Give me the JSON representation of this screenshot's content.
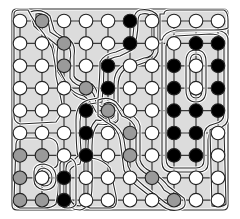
{
  "puzzle": {
    "title": "Grid loop puzzle",
    "cols": 10,
    "rows": 9,
    "origin": {
      "x": 20,
      "y": 21
    },
    "spacing": {
      "x": 22.0,
      "y": 22.4
    },
    "colors": {
      "background": "#ffffff",
      "region_fill": "#dcdcdc",
      "grid_line": "#3a3a3a",
      "outline": "#2a2a2a",
      "white_stone": "#ffffff",
      "gray_stone": "#9a9a9a",
      "black_stone": "#000000"
    },
    "legend": {
      "W": "white",
      "G": "gray",
      "B": "black"
    },
    "cells": [
      [
        "W",
        "G",
        "W",
        "W",
        "W",
        "B",
        "W",
        "W",
        "W",
        "W"
      ],
      [
        "W",
        "W",
        "G",
        "W",
        "W",
        "B",
        "W",
        "W",
        "B",
        "B"
      ],
      [
        "W",
        "W",
        "G",
        "W",
        "B",
        "W",
        "W",
        "B",
        "W",
        "B"
      ],
      [
        "W",
        "W",
        "W",
        "G",
        "B",
        "W",
        "W",
        "B",
        "W",
        "B"
      ],
      [
        "W",
        "W",
        "W",
        "B",
        "G",
        "W",
        "W",
        "B",
        "B",
        "B"
      ],
      [
        "W",
        "W",
        "W",
        "B",
        "W",
        "G",
        "W",
        "B",
        "B",
        "W"
      ],
      [
        "G",
        "G",
        "W",
        "B",
        "W",
        "G",
        "W",
        "B",
        "B",
        "W"
      ],
      [
        "G",
        "W",
        "B",
        "W",
        "W",
        "W",
        "G",
        "W",
        "W",
        "W"
      ],
      [
        "G",
        "G",
        "B",
        "W",
        "W",
        "W",
        "W",
        "G",
        "W",
        "W"
      ]
    ],
    "outlines": [
      {
        "name": "outer-border",
        "d": "M12,14 Q12,9 17,9 L223,9 Q228,9 228,14 L228,205 Q228,210 223,210 L17,210 Q12,210 12,205 Z"
      },
      {
        "name": "gray-snake-top-outer",
        "d": "M30,12 Q42,8 50,16 L54,30 Q58,36 70,40 Q76,46 74,56 L74,76 Q76,82 92,84 Q98,90 98,98 L102,104 Q112,100 118,108 L118,118 Q116,124 108,122 L98,116 Q92,104 86,100 Q76,98 72,92 L58,72 Q54,64 54,50 L52,40 Q40,32 34,26 Z"
      },
      {
        "name": "gray-snake-top-inner",
        "d": "M36,14 Q44,12 48,20 L50,32 Q60,38 68,44 Q72,52 70,60 L70,78 Q74,86 88,88 Q96,94 96,104 L104,108 Q114,106 114,114 Q112,120 104,118 L96,112 Q90,100 84,96 Q74,94 68,86 L58,68 Q56,58 58,46 L48,38 Q38,30 36,22 Z"
      },
      {
        "name": "black-snake-outer",
        "d": "M140,10 Q152,8 158,16 L158,52 Q156,60 146,62 L124,70 Q118,76 118,86 L118,120 Q116,126 98,124 Q92,130 92,146 L92,186 Q92,208 80,210 Q68,210 66,200 L66,168 Q66,162 74,160 L78,156 Q76,150 76,120 Q76,104 88,100 L98,98 Q100,78 100,62 Q104,54 116,52 L130,46 Q134,38 134,20 Q134,12 140,10 Z"
      },
      {
        "name": "black-snake-inner",
        "d": "M142,14 Q150,12 154,20 L154,50 Q152,58 144,58 L122,66 Q114,72 114,84 L114,116 Q110,122 96,120 Q88,128 88,146 L88,190 Q88,204 80,206 Q72,206 70,198 L70,170 Q72,166 80,164 L82,156 Q80,148 80,122 Q80,108 90,104 L102,102 Q104,82 104,64 Q108,58 120,56 L132,50 Q138,40 138,22 Q138,14 142,14 Z"
      },
      {
        "name": "gray-snake-bottom-outer",
        "d": "M98,100 Q108,96 116,102 L124,112 Q138,116 140,126 L140,160 Q142,168 152,172 Q162,178 168,186 L184,198 Q188,208 178,210 Q168,212 160,204 L142,190 Q128,180 124,170 L120,140 Q118,128 106,122 L98,116 Z"
      },
      {
        "name": "gray-snake-bottom-inner",
        "d": "M104,104 Q110,100 116,106 L122,116 Q134,120 136,130 L136,162 Q138,170 150,176 Q160,182 164,190 L180,200 Q182,206 176,206 Q168,206 162,200 L144,186 Q132,176 128,166 L124,140 Q122,128 110,122 Z"
      },
      {
        "name": "black-block-outer",
        "d": "M162,42 Q162,34 170,32 L212,30 Q228,30 228,40 L228,118 Q228,126 218,128 Q208,130 208,140 L208,164 Q208,172 198,172 L172,172 Q162,172 162,162 Z"
      },
      {
        "name": "black-block-inner",
        "d": "M166,46 Q168,38 176,36 L210,34 Q224,34 224,44 L224,114 Q224,122 214,124 Q204,126 204,136 L204,160 Q204,168 196,168 L174,168 Q166,168 166,158 Z"
      },
      {
        "name": "black-block-hole-outer",
        "d": "M186,62 Q186,50 196,50 Q206,50 206,62 L206,90 Q206,102 196,102 Q186,102 186,90 Z"
      },
      {
        "name": "black-block-hole-inner",
        "d": "M190,62 Q190,54 196,54 Q202,54 202,62 L202,90 Q202,98 196,98 Q190,98 190,90 Z"
      },
      {
        "name": "right-top-row-loop",
        "d": "M164,14 Q164,10 170,10 L224,10 Q228,12 228,20 L228,28 Q224,30 214,30 L176,30 Q164,32 162,40 L160,40 L160,14 Z"
      },
      {
        "name": "right-col-lower-loop",
        "d": "M210,130 Q218,124 224,130 L226,204 Q222,208 212,206 Z"
      },
      {
        "name": "left-top-region",
        "d": "M14,14 Q14,10 20,10 L28,10 Q34,22 44,34 L52,48 Q56,66 56,76 L62,104 Q64,112 56,122 L20,124 Q14,122 14,116 Z"
      },
      {
        "name": "bottom-left-outer",
        "d": "M16,144 Q16,138 24,138 L50,138 Q58,140 58,148 L58,162 Q58,168 52,168 Q60,176 58,192 L56,204 Q52,208 44,208 L20,208 Q14,206 14,200 Z"
      },
      {
        "name": "bottom-left-hole-outer",
        "d": "M34,172 Q34,164 44,164 Q56,166 56,178 Q56,190 44,190 Q34,188 34,180 Z"
      },
      {
        "name": "bottom-left-hole-inner",
        "d": "M37,174 Q38,168 44,168 Q52,170 52,178 Q52,186 44,186 Q38,184 37,180 Z"
      },
      {
        "name": "bottom-col3-loop",
        "d": "M60,164 Q62,158 70,158 Q76,160 76,168 L76,204 Q74,208 68,208 Q60,208 60,202 Z"
      },
      {
        "name": "bottom-middle-region",
        "d": "M84,164 Q84,160 92,158 Q104,160 110,168 L116,196 Q118,208 110,208 L90,208 Q84,206 84,200 Z"
      }
    ]
  }
}
